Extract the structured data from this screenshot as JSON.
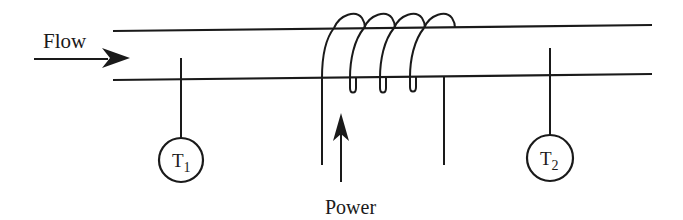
{
  "diagram": {
    "type": "heated-pipe-flow-schematic",
    "labels": {
      "flow": "Flow",
      "power": "Power",
      "sensor1_letter": "T",
      "sensor1_sub": "1",
      "sensor2_letter": "T",
      "sensor2_sub": "2"
    },
    "components": [
      {
        "id": "pipe",
        "description": "Horizontal pipe (two parallel lines)"
      },
      {
        "id": "flow-arrow",
        "description": "Arrow pointing right into pipe",
        "label": "Flow"
      },
      {
        "id": "heater-coil",
        "description": "Helical heating coil wrapped around pipe, 4 turns"
      },
      {
        "id": "power-arrow",
        "description": "Upward arrow feeding power to the coil",
        "label": "Power"
      },
      {
        "id": "sensor-t1",
        "description": "Upstream temperature probe",
        "label": "T1"
      },
      {
        "id": "sensor-t2",
        "description": "Downstream temperature probe",
        "label": "T2"
      }
    ],
    "colors": {
      "stroke": "#1a1a1a",
      "background": "#ffffff"
    }
  }
}
